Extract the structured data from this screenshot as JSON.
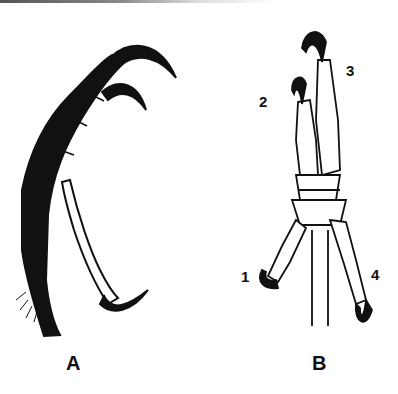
{
  "figure": {
    "panels": [
      {
        "id": "A",
        "label": "A",
        "description": "raptor talon side view"
      },
      {
        "id": "B",
        "label": "B",
        "description": "bird foot front view with numbered toes"
      }
    ],
    "toe_labels": [
      "1",
      "2",
      "3",
      "4"
    ]
  }
}
